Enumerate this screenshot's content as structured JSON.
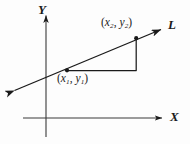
{
  "figure": {
    "type": "coordinate-geometry-diagram",
    "background_color": "#fdfdfd",
    "ink_color": "#1a1a1a"
  },
  "axes": {
    "x_label": "X",
    "y_label": "Y",
    "origin": {
      "x": 46,
      "y": 118
    },
    "x_axis": {
      "x1": 23,
      "y1": 118,
      "x2": 163,
      "y2": 118,
      "arrow": "right"
    },
    "y_axis": {
      "x1": 46,
      "y1": 137,
      "x2": 46,
      "y2": 14,
      "arrow": "up"
    }
  },
  "line": {
    "label": "L",
    "arrow_start": {
      "x": 12,
      "y": 92
    },
    "arrow_end": {
      "x": 164,
      "y": 28
    },
    "double_headed": true
  },
  "points": [
    {
      "name": "point-1",
      "label_parts": {
        "open": "(",
        "x_var": "x",
        "x_sub": "1",
        "comma": ", ",
        "y_var": "y",
        "y_sub": "1",
        "close": ")"
      },
      "label_text": "(x1, y1)",
      "position": {
        "x": 67,
        "y": 70
      }
    },
    {
      "name": "point-2",
      "label_parts": {
        "open": "(",
        "x_var": "x",
        "x_sub": "2",
        "comma": ", ",
        "y_var": "y",
        "y_sub": "2",
        "close": ")"
      },
      "label_text": "(x2, y2)",
      "position": {
        "x": 136,
        "y": 38
      }
    }
  ],
  "triangle": {
    "name": "slope-right-triangle",
    "horizontal_leg": {
      "x1": 67,
      "y1": 70,
      "x2": 136,
      "y2": 70
    },
    "vertical_leg": {
      "x1": 136,
      "y1": 70,
      "x2": 136,
      "y2": 38
    }
  }
}
